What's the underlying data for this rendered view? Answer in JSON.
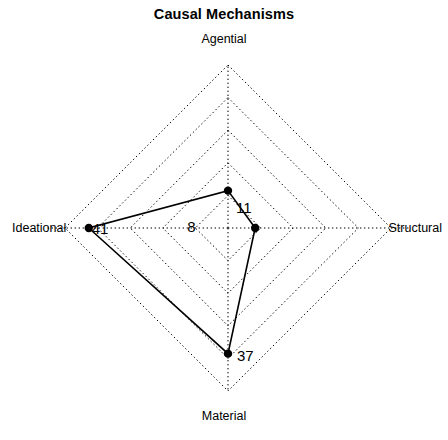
{
  "chart_data": {
    "type": "radar",
    "title": "Causal Mechanisms",
    "subtitle": "",
    "xlabel": "",
    "ylabel": "",
    "categories": [
      "Agential",
      "Structural",
      "Material",
      "Ideational"
    ],
    "values": [
      11,
      8,
      37,
      41
    ],
    "value_labels": [
      "11",
      "8",
      "37",
      "41"
    ],
    "series": [
      {
        "name": "Causal Mechanisms",
        "values": [
          11,
          8,
          37,
          41
        ]
      }
    ],
    "axis_order": "clockwise-from-top",
    "rlim": [
      0,
      48
    ],
    "grid": true,
    "grid_rings": 5,
    "grid_style": "dotted",
    "legend": "none",
    "legend_position": "none",
    "marker": "filled-circle",
    "line_style": "solid",
    "colors": {
      "line": "#000000",
      "marker": "#000000",
      "grid": "#000000",
      "background": "#ffffff",
      "text": "#000000"
    }
  },
  "chart": {
    "title": "Causal Mechanisms",
    "axes": {
      "top": "Agential",
      "right": "Structural",
      "bottom": "Material",
      "left": "Ideational"
    },
    "point_values": {
      "agential": "11",
      "structural": "8",
      "material": "37",
      "ideational": "41"
    }
  },
  "geometry": {
    "center_x": 228,
    "center_y": 228,
    "max_radius": 163,
    "rings": 5
  }
}
